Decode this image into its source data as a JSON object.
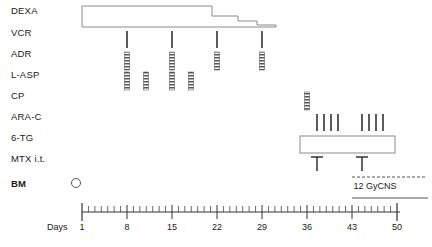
{
  "figure": {
    "type": "treatment-schedule-timeline",
    "axis_title": "Days"
  },
  "rows": [
    {
      "key": "dexa",
      "label": "DEXA",
      "bold": false
    },
    {
      "key": "vcr",
      "label": "VCR",
      "bold": false
    },
    {
      "key": "adr",
      "label": "ADR",
      "bold": false
    },
    {
      "key": "lasp",
      "label": "L-ASP",
      "bold": false
    },
    {
      "key": "cp",
      "label": "CP",
      "bold": false
    },
    {
      "key": "arac",
      "label": "ARA-C",
      "bold": false
    },
    {
      "key": "tg",
      "label": "6-TG",
      "bold": false
    },
    {
      "key": "mtx",
      "label": "MTX i.t.",
      "bold": false
    },
    {
      "key": "bm",
      "label": "BM",
      "bold": true
    }
  ],
  "axis": {
    "label": "Days",
    "min_day": 1,
    "max_day": 50,
    "tick_labels": [
      "1",
      "8",
      "15",
      "22",
      "29",
      "36",
      "43",
      "50"
    ],
    "tick_days": [
      1,
      8,
      15,
      22,
      29,
      36,
      43,
      50
    ],
    "minor_tick_interval_days": 1
  },
  "annotations": {
    "radiation_label": "12 GyCNS",
    "radiation_start_day": 43,
    "radiation_end_day": 50
  },
  "chart_data": {
    "type": "table",
    "title": "",
    "xlabel": "Days",
    "ylabel": "",
    "xlim": [
      1,
      50
    ],
    "grid": false,
    "legend": "none",
    "categories": [
      "DEXA",
      "VCR",
      "ADR",
      "L-ASP",
      "CP",
      "ARA-C",
      "6-TG",
      "MTX i.t.",
      "BM"
    ],
    "series": [
      {
        "name": "DEXA",
        "marker": "tapering-bar",
        "segments": [
          {
            "start_day": 1,
            "end_day": 29,
            "level": 3
          },
          {
            "start_day": 29,
            "end_day": 33,
            "level": 2
          },
          {
            "start_day": 33,
            "end_day": 36,
            "level": 1
          },
          {
            "start_day": 36,
            "end_day": 39,
            "level": 0
          }
        ]
      },
      {
        "name": "VCR",
        "marker": "thin-tick",
        "days": [
          8,
          15,
          22,
          29
        ]
      },
      {
        "name": "ADR",
        "marker": "hatched-bar",
        "days": [
          8,
          15,
          22,
          29
        ]
      },
      {
        "name": "L-ASP",
        "marker": "hatched-bar",
        "days": [
          8,
          11,
          15,
          18
        ]
      },
      {
        "name": "CP",
        "marker": "hatched-bar",
        "days": [
          36
        ]
      },
      {
        "name": "ARA-C",
        "marker": "thin-tick",
        "days": [
          38,
          39,
          40,
          41,
          45,
          46,
          47,
          48
        ]
      },
      {
        "name": "6-TG",
        "marker": "open-box",
        "segments": [
          {
            "start_day": 37,
            "end_day": 50
          }
        ]
      },
      {
        "name": "MTX i.t.",
        "marker": "t-arrow",
        "days": [
          38,
          45
        ]
      },
      {
        "name": "BM",
        "marker": "open-circle",
        "days": [
          1
        ]
      }
    ]
  }
}
